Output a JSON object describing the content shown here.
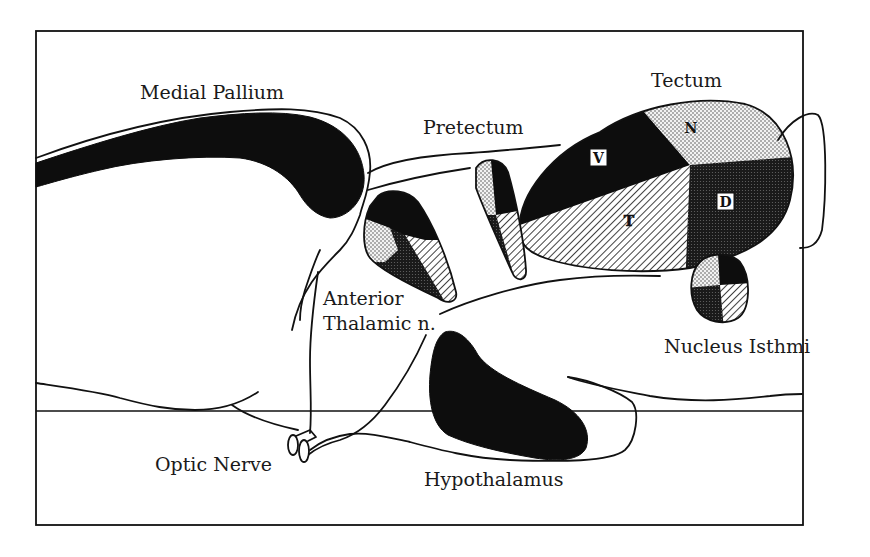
{
  "figure": {
    "type": "sagittal brain schematic",
    "colors": {
      "ink": "#111111",
      "background": "#ffffff",
      "solid_region": "#0d0d0d",
      "light_stipple": "#e8e8e8",
      "dark_stipple": "#2a2a2a"
    }
  },
  "labels": {
    "medial_pallium": "Medial Pallium",
    "tectum": "Tectum",
    "pretectum": "Pretectum",
    "anterior_thalamic_line1": "Anterior",
    "anterior_thalamic_line2": "Thalamic n.",
    "nucleus_isthmi": "Nucleus Isthmi",
    "optic_nerve": "Optic Nerve",
    "hypothalamus": "Hypothalamus"
  },
  "tectum_quadrants": {
    "nasal": "N",
    "ventral": "V",
    "dorsal": "D",
    "temporal": "T"
  },
  "legend_patterns": {
    "N": "light stipple",
    "V": "solid black",
    "D": "dark stipple",
    "T": "diagonal hatch"
  }
}
